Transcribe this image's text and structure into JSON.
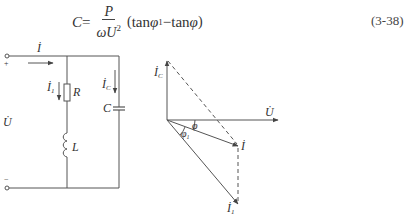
{
  "formula": {
    "lhs": "C",
    "equals": "=",
    "numerator": "P",
    "denominator_base": "ωU",
    "denominator_exp": "2",
    "open_paren": "(",
    "tan1": "tan",
    "phi1": "φ",
    "phi1_sub": "1",
    "minus": " − ",
    "tan2": "tan",
    "phi2": "φ",
    "close_paren": ")",
    "equation_number": "(3-38)"
  },
  "circuit": {
    "current_label": "İ",
    "voltage_label": "U̇",
    "plus_sign": "+",
    "minus_sign": "−",
    "branch_current_label": "İ",
    "branch_current_sub": "1",
    "capacitor_current_label": "İ",
    "capacitor_current_sub": "C",
    "resistor_label": "R",
    "inductor_label": "L",
    "capacitor_label": "C"
  },
  "phasor": {
    "ic_label": "İ",
    "ic_sub": "C",
    "u_label": "U̇",
    "i_label": "İ",
    "i1_label": "İ",
    "i1_sub": "1",
    "phi_label": "φ",
    "phi1_label": "φ",
    "phi1_sub": "1"
  }
}
